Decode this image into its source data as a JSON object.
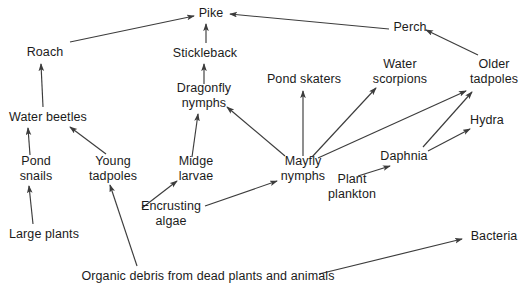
{
  "diagram": {
    "type": "food-web",
    "width": 530,
    "height": 293,
    "background_color": "#ffffff",
    "text_color": "#1b1b1b",
    "edge_color": "#3c3c3c",
    "nodes": [
      {
        "id": "pike",
        "label": "Pike",
        "x": 211,
        "y": 13,
        "lines": 1
      },
      {
        "id": "perch",
        "label": "Perch",
        "x": 410,
        "y": 27,
        "lines": 1
      },
      {
        "id": "roach",
        "label": "Roach",
        "x": 45,
        "y": 52,
        "lines": 1
      },
      {
        "id": "stickleback",
        "label": "Stickleback",
        "x": 205,
        "y": 53,
        "lines": 1
      },
      {
        "id": "water_scorpions",
        "label": "Water\nscorpions",
        "x": 400,
        "y": 72,
        "lines": 2
      },
      {
        "id": "older_tadpoles",
        "label": "Older\ntadpoles",
        "x": 494,
        "y": 72,
        "lines": 2
      },
      {
        "id": "pond_skaters",
        "label": "Pond skaters",
        "x": 304,
        "y": 79,
        "lines": 1
      },
      {
        "id": "dragonfly",
        "label": "Dragonfly\nnymphs",
        "x": 204,
        "y": 96,
        "lines": 2
      },
      {
        "id": "water_beetles",
        "label": "Water beetles",
        "x": 48,
        "y": 117,
        "lines": 1
      },
      {
        "id": "hydra",
        "label": "Hydra",
        "x": 487,
        "y": 120,
        "lines": 1
      },
      {
        "id": "daphnia",
        "label": "Daphnia",
        "x": 404,
        "y": 156,
        "lines": 1
      },
      {
        "id": "pond_snails",
        "label": "Pond\nsnails",
        "x": 36,
        "y": 169,
        "lines": 2
      },
      {
        "id": "young_tadpoles",
        "label": "Young\ntadpoles",
        "x": 113,
        "y": 169,
        "lines": 2
      },
      {
        "id": "midge_larvae",
        "label": "Midge\nlarvae",
        "x": 196,
        "y": 169,
        "lines": 2
      },
      {
        "id": "mayfly",
        "label": "Mayfly\nnymphs",
        "x": 303,
        "y": 169,
        "lines": 2
      },
      {
        "id": "plant_plankton",
        "label": "Plant\nplankton",
        "x": 352,
        "y": 187,
        "lines": 2
      },
      {
        "id": "encrusting_algae",
        "label": "Encrusting\nalgae",
        "x": 171,
        "y": 214,
        "lines": 2
      },
      {
        "id": "large_plants",
        "label": "Large plants",
        "x": 44,
        "y": 234,
        "lines": 1
      },
      {
        "id": "bacteria",
        "label": "Bacteria",
        "x": 494,
        "y": 236,
        "lines": 1
      },
      {
        "id": "organic_debris",
        "label": "Organic debris from dead plants and animals",
        "x": 208,
        "y": 276,
        "lines": 1
      }
    ],
    "edges": [
      {
        "from": "roach",
        "to": "pike",
        "x1": 70,
        "y1": 42,
        "x2": 194,
        "y2": 16
      },
      {
        "from": "perch",
        "to": "pike",
        "x1": 389,
        "y1": 29,
        "x2": 230,
        "y2": 14
      },
      {
        "from": "stickleback",
        "to": "pike",
        "x1": 206,
        "y1": 43,
        "x2": 206,
        "y2": 24
      },
      {
        "from": "older_tadpoles",
        "to": "perch",
        "x1": 478,
        "y1": 55,
        "x2": 426,
        "y2": 30
      },
      {
        "from": "water_beetles",
        "to": "roach",
        "x1": 43,
        "y1": 107,
        "x2": 41,
        "y2": 64
      },
      {
        "from": "dragonfly",
        "to": "stickleback",
        "x1": 204,
        "y1": 84,
        "x2": 204,
        "y2": 64
      },
      {
        "from": "pond_snails",
        "to": "water_beetles",
        "x1": 30,
        "y1": 155,
        "x2": 28,
        "y2": 128
      },
      {
        "from": "young_tadpoles",
        "to": "water_beetles",
        "x1": 106,
        "y1": 154,
        "x2": 70,
        "y2": 127
      },
      {
        "from": "midge_larvae",
        "to": "dragonfly",
        "x1": 192,
        "y1": 157,
        "x2": 198,
        "y2": 114
      },
      {
        "from": "mayfly",
        "to": "dragonfly",
        "x1": 285,
        "y1": 156,
        "x2": 227,
        "y2": 107
      },
      {
        "from": "mayfly",
        "to": "pond_skaters",
        "x1": 303,
        "y1": 156,
        "x2": 303,
        "y2": 91
      },
      {
        "from": "mayfly",
        "to": "water_scorpions",
        "x1": 312,
        "y1": 157,
        "x2": 376,
        "y2": 88
      },
      {
        "from": "mayfly",
        "to": "older_tadpoles",
        "x1": 318,
        "y1": 158,
        "x2": 466,
        "y2": 91
      },
      {
        "from": "daphnia",
        "to": "hydra",
        "x1": 428,
        "y1": 151,
        "x2": 470,
        "y2": 129
      },
      {
        "from": "daphnia",
        "to": "older_tadpoles",
        "x1": 423,
        "y1": 147,
        "x2": 472,
        "y2": 92
      },
      {
        "from": "large_plants",
        "to": "pond_snails",
        "x1": 33,
        "y1": 224,
        "x2": 29,
        "y2": 186
      },
      {
        "from": "encrusting_algae",
        "to": "midge_larvae",
        "x1": 142,
        "y1": 208,
        "x2": 177,
        "y2": 181
      },
      {
        "from": "encrusting_algae",
        "to": "mayfly",
        "x1": 205,
        "y1": 206,
        "x2": 277,
        "y2": 181
      },
      {
        "from": "plant_plankton",
        "to": "daphnia",
        "x1": 358,
        "y1": 176,
        "x2": 390,
        "y2": 166
      },
      {
        "from": "organic_debris",
        "to": "young_tadpoles",
        "x1": 137,
        "y1": 266,
        "x2": 110,
        "y2": 185
      },
      {
        "from": "organic_debris",
        "to": "bacteria",
        "x1": 319,
        "y1": 274,
        "x2": 462,
        "y2": 239
      }
    ]
  }
}
